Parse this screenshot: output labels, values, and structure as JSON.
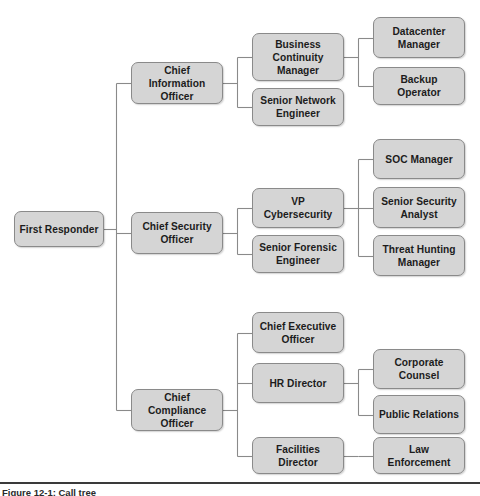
{
  "figure": {
    "caption": "Figure 12-1: Call tree",
    "background_color": "#ffffff",
    "node_fill_color": "#d5d5d5",
    "node_border_color": "#8a8a8a",
    "connector_color": "#8a8a8a",
    "text_color": "#1c1c1c"
  },
  "chart_data": {
    "type": "diagram",
    "diagram_type": "org-chart",
    "title": "Call tree",
    "orientation": "left-to-right",
    "levels": 4,
    "node_count": 16,
    "root": "first-responder",
    "nodes": [
      {
        "id": "first-responder",
        "label": "First Responder",
        "level": 0,
        "x": 14,
        "y": 211,
        "w": 90,
        "h": 36
      },
      {
        "id": "chief-information-officer",
        "label": "Chief Information\nOfficer",
        "level": 1,
        "x": 131,
        "y": 62,
        "w": 92,
        "h": 42
      },
      {
        "id": "chief-security-officer",
        "label": "Chief Security\nOfficer",
        "level": 1,
        "x": 131,
        "y": 212,
        "w": 92,
        "h": 42
      },
      {
        "id": "chief-compliance-officer",
        "label": "Chief Compliance\nOfficer",
        "level": 1,
        "x": 131,
        "y": 389,
        "w": 92,
        "h": 42
      },
      {
        "id": "business-continuity-manager",
        "label": "Business\nContinuity\nManager",
        "level": 2,
        "x": 252,
        "y": 33,
        "w": 92,
        "h": 48
      },
      {
        "id": "senior-network-engineer",
        "label": "Senior Network\nEngineer",
        "level": 2,
        "x": 252,
        "y": 88,
        "w": 92,
        "h": 38
      },
      {
        "id": "vp-cybersecurity",
        "label": "VP Cybersecurity",
        "level": 2,
        "x": 252,
        "y": 188,
        "w": 92,
        "h": 40
      },
      {
        "id": "senior-forensic-engineer",
        "label": "Senior Forensic\nEngineer",
        "level": 2,
        "x": 252,
        "y": 235,
        "w": 92,
        "h": 38
      },
      {
        "id": "chief-executive-officer",
        "label": "Chief Executive\nOfficer",
        "level": 2,
        "x": 252,
        "y": 312,
        "w": 92,
        "h": 41
      },
      {
        "id": "hr-director",
        "label": "HR Director",
        "level": 2,
        "x": 252,
        "y": 363,
        "w": 92,
        "h": 40
      },
      {
        "id": "facilities-director",
        "label": "Facilities Director",
        "level": 2,
        "x": 252,
        "y": 437,
        "w": 92,
        "h": 37
      },
      {
        "id": "datacenter-manager",
        "label": "Datacenter\nManager",
        "level": 3,
        "x": 373,
        "y": 17,
        "w": 92,
        "h": 41
      },
      {
        "id": "backup-operator",
        "label": "Backup Operator",
        "level": 3,
        "x": 373,
        "y": 67,
        "w": 92,
        "h": 38
      },
      {
        "id": "soc-manager",
        "label": "SOC Manager",
        "level": 3,
        "x": 373,
        "y": 139,
        "w": 92,
        "h": 40
      },
      {
        "id": "senior-security-analyst",
        "label": "Senior Security\nAnalyst",
        "level": 3,
        "x": 373,
        "y": 187,
        "w": 92,
        "h": 41
      },
      {
        "id": "threat-hunting-manager",
        "label": "Threat Hunting\nManager",
        "level": 3,
        "x": 373,
        "y": 235,
        "w": 92,
        "h": 41
      },
      {
        "id": "corporate-counsel",
        "label": "Corporate Counsel",
        "level": 3,
        "x": 373,
        "y": 349,
        "w": 92,
        "h": 40
      },
      {
        "id": "public-relations",
        "label": "Public Relations",
        "level": 3,
        "x": 373,
        "y": 395,
        "w": 92,
        "h": 39
      },
      {
        "id": "law-enforcement",
        "label": "Law Enforcement",
        "level": 3,
        "x": 373,
        "y": 437,
        "w": 92,
        "h": 37
      }
    ],
    "edges": [
      {
        "from": "first-responder",
        "to": "chief-information-officer"
      },
      {
        "from": "first-responder",
        "to": "chief-security-officer"
      },
      {
        "from": "first-responder",
        "to": "chief-compliance-officer"
      },
      {
        "from": "chief-information-officer",
        "to": "business-continuity-manager"
      },
      {
        "from": "chief-information-officer",
        "to": "senior-network-engineer"
      },
      {
        "from": "business-continuity-manager",
        "to": "datacenter-manager"
      },
      {
        "from": "business-continuity-manager",
        "to": "backup-operator"
      },
      {
        "from": "chief-security-officer",
        "to": "vp-cybersecurity"
      },
      {
        "from": "chief-security-officer",
        "to": "senior-forensic-engineer"
      },
      {
        "from": "vp-cybersecurity",
        "to": "soc-manager"
      },
      {
        "from": "vp-cybersecurity",
        "to": "senior-security-analyst"
      },
      {
        "from": "vp-cybersecurity",
        "to": "threat-hunting-manager"
      },
      {
        "from": "chief-compliance-officer",
        "to": "chief-executive-officer"
      },
      {
        "from": "chief-compliance-officer",
        "to": "hr-director"
      },
      {
        "from": "chief-compliance-officer",
        "to": "facilities-director"
      },
      {
        "from": "hr-director",
        "to": "corporate-counsel"
      },
      {
        "from": "hr-director",
        "to": "public-relations"
      },
      {
        "from": "facilities-director",
        "to": "law-enforcement"
      }
    ]
  }
}
